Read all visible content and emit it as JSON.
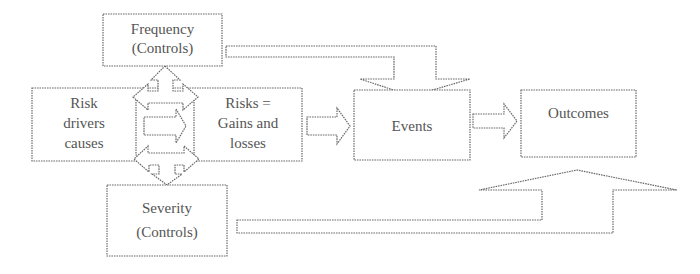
{
  "diagram": {
    "colors": {
      "stroke": "#6a6a6a",
      "text": "#555555",
      "background": "#ffffff"
    },
    "nodes": {
      "frequency": {
        "line1": "Frequency",
        "line2": "(Controls)"
      },
      "risk_drivers": {
        "line1": "Risk",
        "line2": "drivers",
        "line3": "causes"
      },
      "risks": {
        "line1": "Risks =",
        "line2": "Gains and",
        "line3": "losses"
      },
      "events": {
        "label": "Events"
      },
      "outcomes": {
        "label": "Outcomes"
      },
      "severity": {
        "line1": "Severity",
        "line2": "(Controls)"
      }
    },
    "edges": [
      {
        "from": "frequency",
        "to": "risk_drivers/risks",
        "type": "bidirectional-block-arrow"
      },
      {
        "from": "risk_drivers",
        "to": "risks",
        "type": "block-arrow"
      },
      {
        "from": "risk_drivers/risks",
        "to": "severity",
        "type": "bidirectional-block-arrow"
      },
      {
        "from": "risks",
        "to": "events",
        "type": "block-arrow"
      },
      {
        "from": "frequency",
        "to": "events",
        "type": "elbow-block-arrow"
      },
      {
        "from": "events",
        "to": "outcomes",
        "type": "block-arrow"
      },
      {
        "from": "severity",
        "to": "outcomes",
        "type": "elbow-block-arrow"
      }
    ]
  }
}
